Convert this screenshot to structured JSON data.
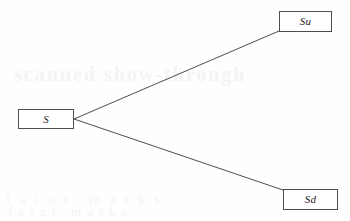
{
  "diagram": {
    "type": "tree",
    "background_color": "#fefefe",
    "line_color": "#4d4d4d",
    "border_color": "#4d4d4d",
    "text_color": "#1a1a1a",
    "nodes": [
      {
        "id": "s",
        "label": "S",
        "role": "root",
        "x": 18,
        "y": 109,
        "width": 56,
        "height": 20
      },
      {
        "id": "su",
        "label": "Su",
        "role": "up-state",
        "x": 279,
        "y": 11,
        "width": 53,
        "height": 21
      },
      {
        "id": "sd",
        "label": "Sd",
        "role": "down-state",
        "x": 283,
        "y": 189,
        "width": 55,
        "height": 21
      }
    ],
    "edges": [
      {
        "id": "edge-up",
        "from": "s",
        "to": "su",
        "x1": 74,
        "y1": 119,
        "x2": 279,
        "y2": 31
      },
      {
        "id": "edge-down",
        "from": "s",
        "to": "sd",
        "x1": 74,
        "y1": 119,
        "x2": 283,
        "y2": 190
      }
    ]
  },
  "artifacts": {
    "ghost_mid": "scanned show-through",
    "ghost_bottom": "faint marks",
    "ghost_bottom2": "faint marks"
  }
}
